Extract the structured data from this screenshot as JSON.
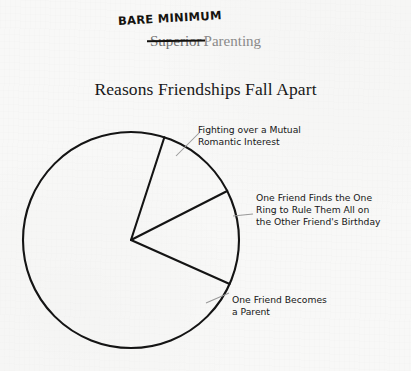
{
  "page": {
    "background_color": "#f8f8f7",
    "ink_color": "#161616",
    "printed_gray": "#8b8b8b"
  },
  "header": {
    "handwritten_correction": "BARE MINIMUM",
    "struck_word": "Superior",
    "kept_word": "Parenting"
  },
  "chart_data": {
    "type": "pie",
    "title": "Reasons Friendships Fall Apart",
    "xlabel": "",
    "ylabel": "",
    "grid": false,
    "legend_position": "callout-labels",
    "style": {
      "fill": "none",
      "stroke": "#141414",
      "stroke_width": 2,
      "center_x": 131,
      "center_y": 240,
      "radius": 108
    },
    "categories": [
      "Fighting over a Mutual Romantic Interest",
      "One Friend Finds the One Ring to Rule Them All on the Other Friend's Birthday",
      "One Friend Becomes a Parent"
    ],
    "values": [
      12.5,
      14.2,
      73.3
    ],
    "slices": [
      {
        "label": "Fighting over a Mutual Romantic Interest",
        "percent": 12.5,
        "start_angle_deg": -72,
        "end_angle_deg": -27,
        "leader": "diagonal"
      },
      {
        "label": "One Friend Finds the One Ring to Rule Them All on the Other Friend's Birthday",
        "percent": 14.2,
        "start_angle_deg": -27,
        "end_angle_deg": 24,
        "leader": "horizontal"
      },
      {
        "label": "One Friend Becomes a Parent",
        "percent": 73.3,
        "start_angle_deg": 24,
        "end_angle_deg": 288,
        "leader": "diagonal"
      }
    ]
  },
  "callouts": {
    "romantic": "Fighting over a Mutual\nRomantic Interest",
    "one_ring": "One Friend Finds the One\nRing to Rule Them All on\nthe Other Friend's Birthday",
    "parent": "One Friend Becomes\na Parent"
  }
}
